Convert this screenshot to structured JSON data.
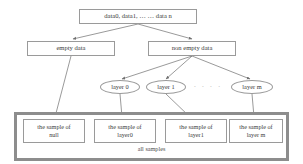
{
  "diagram": {
    "root": {
      "label": "data0, data1, … … data n"
    },
    "branches": [
      {
        "label": "empty data"
      },
      {
        "label": "non empty data"
      }
    ],
    "layers": [
      {
        "label": "layer 0"
      },
      {
        "label": "layer 1"
      },
      {
        "label": "layer m"
      }
    ],
    "ellipsis": "· · · ·",
    "samples": [
      {
        "line1": "the sample of",
        "line2": "null"
      },
      {
        "line1": "the sample of",
        "line2": "layer0"
      },
      {
        "line1": "the sample of",
        "line2": "layer1"
      },
      {
        "line1": "the sample of",
        "line2": "layer m"
      }
    ],
    "group_label": "all samples",
    "colors": {
      "node_border": "#9a9a9a",
      "frame_border": "#8d8d8d",
      "edge": "#6f6f6f",
      "text": "#3b3b3b",
      "background": "#ffffff"
    }
  }
}
